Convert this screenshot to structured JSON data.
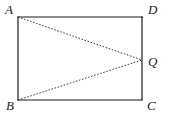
{
  "figure": {
    "type": "geometry-diagram",
    "background_color": "#ffffff",
    "stroke_color": "#1a1a1a",
    "dash_color": "#3a3a3a",
    "solid_line_width": 1.2,
    "dashed_line_width": 1.0,
    "dash_pattern": "1.6 1.6",
    "rectangle": {
      "name": "ABCD",
      "left": 18,
      "top": 17,
      "right": 142,
      "bottom": 100,
      "width": 124,
      "height": 83
    },
    "points": {
      "A": {
        "label": "A",
        "x": 18,
        "y": 17
      },
      "D": {
        "label": "D",
        "x": 142,
        "y": 17
      },
      "B": {
        "label": "B",
        "x": 18,
        "y": 100
      },
      "C": {
        "label": "C",
        "x": 142,
        "y": 100
      },
      "Q": {
        "label": "Q",
        "x": 142,
        "y": 60
      }
    },
    "solid_segments": [
      {
        "name": "AD",
        "from": "A",
        "to": "D"
      },
      {
        "name": "DC",
        "from": "D",
        "to": "C"
      },
      {
        "name": "CB",
        "from": "C",
        "to": "B"
      },
      {
        "name": "BA",
        "from": "B",
        "to": "A"
      }
    ],
    "dashed_segments": [
      {
        "name": "AQ",
        "from": "A",
        "to": "Q"
      },
      {
        "name": "BQ",
        "from": "B",
        "to": "Q"
      }
    ]
  }
}
